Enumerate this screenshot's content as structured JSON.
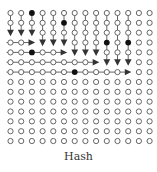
{
  "figure": {
    "caption": "Hash",
    "grid": {
      "rows": 14,
      "cols": 14,
      "x0": 10.5,
      "y0": 13,
      "dx": 10.7,
      "dy": 9.85,
      "radius": 2.6
    },
    "colors": {
      "stroke": "#555555",
      "filled": "#111111",
      "arrow": "#333333",
      "open_fill": "#ffffff"
    },
    "vertical_segments": [
      {
        "col": 0,
        "from_row": 0,
        "to_row": 2
      },
      {
        "col": 1,
        "from_row": 0,
        "to_row": 2
      },
      {
        "col": 2,
        "from_row": 0,
        "to_row": 2
      },
      {
        "col": 3,
        "from_row": 0,
        "to_row": 3
      },
      {
        "col": 4,
        "from_row": 0,
        "to_row": 3
      },
      {
        "col": 5,
        "from_row": 0,
        "to_row": 3
      },
      {
        "col": 6,
        "from_row": 0,
        "to_row": 4
      },
      {
        "col": 7,
        "from_row": 0,
        "to_row": 4
      },
      {
        "col": 8,
        "from_row": 0,
        "to_row": 4
      },
      {
        "col": 9,
        "from_row": 0,
        "to_row": 5
      },
      {
        "col": 10,
        "from_row": 0,
        "to_row": 5
      },
      {
        "col": 11,
        "from_row": 0,
        "to_row": 5
      }
    ],
    "horizontal_segments": [
      {
        "row": 3,
        "from_col": 0,
        "to_col": 2
      },
      {
        "row": 4,
        "from_col": 0,
        "to_col": 5
      },
      {
        "row": 5,
        "from_col": 0,
        "to_col": 8
      },
      {
        "row": 6,
        "from_col": 0,
        "to_col": 11
      }
    ],
    "filled_nodes": [
      {
        "row": 0,
        "col": 2
      },
      {
        "row": 1,
        "col": 5
      },
      {
        "row": 3,
        "col": 9
      },
      {
        "row": 3,
        "col": 11
      },
      {
        "row": 4,
        "col": 2
      },
      {
        "row": 6,
        "col": 6
      }
    ]
  }
}
